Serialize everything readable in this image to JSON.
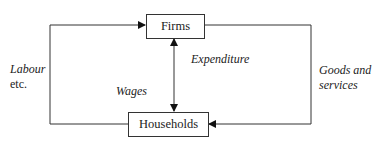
{
  "diagram": {
    "nodes": {
      "firms": "Firms",
      "households": "Households"
    },
    "labels": {
      "labour_line1": "Labour",
      "labour_line2": "etc.",
      "wages": "Wages",
      "expenditure": "Expenditure",
      "goods_line1": "Goods and",
      "goods_line2": "services"
    },
    "edges": [
      {
        "from": "households",
        "to": "firms",
        "label": "Labour etc.",
        "side": "left"
      },
      {
        "from": "firms",
        "to": "households",
        "label": "Goods and services",
        "side": "right"
      },
      {
        "from": "firms",
        "to": "households",
        "label": "Wages",
        "direction": "both",
        "side": "middle"
      },
      {
        "from": "households",
        "to": "firms",
        "label": "Expenditure",
        "direction": "both",
        "side": "middle"
      }
    ],
    "colors": {
      "line": "#333333",
      "background": "#ffffff"
    }
  }
}
